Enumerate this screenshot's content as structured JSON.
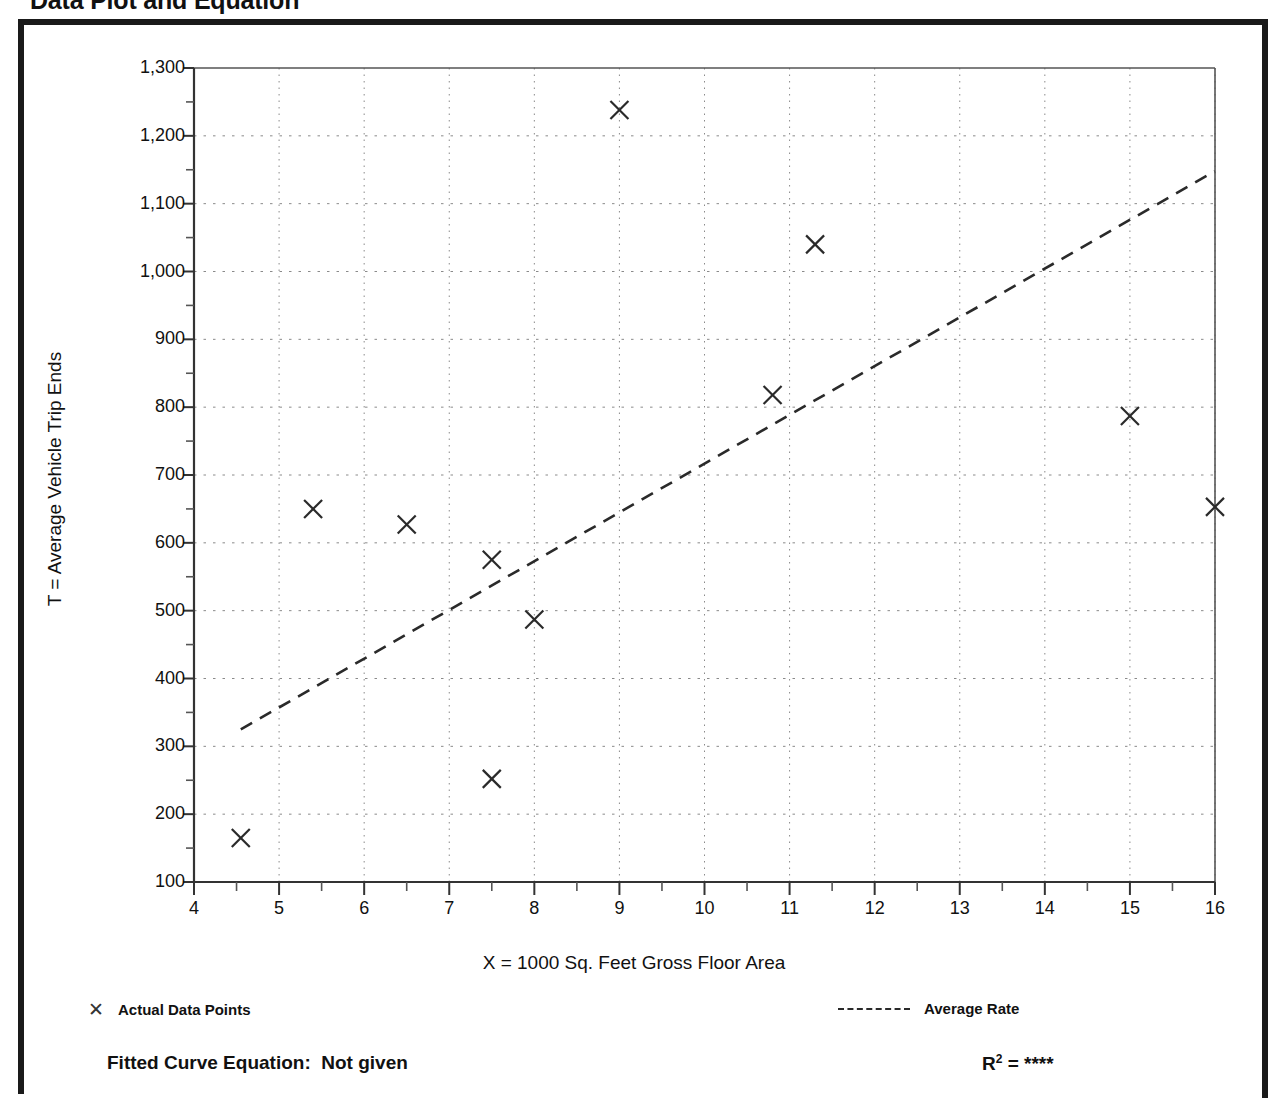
{
  "page": {
    "title": "Data Plot and Equation"
  },
  "legend": {
    "data_points_label": "Actual Data Points",
    "data_points_marker": "x-marker-icon",
    "average_rate_label": "Average Rate",
    "average_rate_marker": "dashed-line-icon"
  },
  "footer": {
    "fitted_curve_label": "Fitted Curve Equation:  Not given",
    "r_squared_prefix": "R",
    "r_squared_exponent": "2",
    "r_squared_equals": " = ",
    "r_squared_value": "****"
  },
  "chart_data": {
    "type": "scatter",
    "title": "Data Plot and Equation",
    "xlabel": "X = 1000 Sq. Feet Gross Floor Area",
    "ylabel": "T = Average Vehicle Trip Ends",
    "xlim": [
      4,
      16
    ],
    "ylim": [
      100,
      1300
    ],
    "xticks": [
      4,
      5,
      6,
      7,
      8,
      9,
      10,
      11,
      12,
      13,
      14,
      15,
      16
    ],
    "xtick_labels": [
      "4",
      "5",
      "6",
      "7",
      "8",
      "9",
      "10",
      "11",
      "12",
      "13",
      "14",
      "15",
      "16"
    ],
    "yticks": [
      100,
      200,
      300,
      400,
      500,
      600,
      700,
      800,
      900,
      1000,
      1100,
      1200,
      1300
    ],
    "ytick_labels": [
      "100",
      "200",
      "300",
      "400",
      "500",
      "600",
      "700",
      "800",
      "900",
      "1,000",
      "1,100",
      "1,200",
      "1,300"
    ],
    "y_minor_tick_step": 50,
    "grid": true,
    "grid_style": "dotted",
    "legend_position": "below-axes",
    "series": [
      {
        "name": "Actual Data Points",
        "type": "scatter",
        "marker": "x",
        "color": "#2a2a2a",
        "points": [
          {
            "x": 4.55,
            "y": 165
          },
          {
            "x": 5.4,
            "y": 650
          },
          {
            "x": 6.5,
            "y": 627
          },
          {
            "x": 7.5,
            "y": 575
          },
          {
            "x": 7.5,
            "y": 252
          },
          {
            "x": 8.0,
            "y": 487
          },
          {
            "x": 9.0,
            "y": 1238
          },
          {
            "x": 10.8,
            "y": 818
          },
          {
            "x": 11.3,
            "y": 1040
          },
          {
            "x": 15.0,
            "y": 787
          },
          {
            "x": 16.0,
            "y": 653
          }
        ]
      },
      {
        "name": "Average Rate",
        "type": "line",
        "linestyle": "dashed",
        "color": "#2a2a2a",
        "endpoints": [
          {
            "x": 4.55,
            "y": 325
          },
          {
            "x": 16.0,
            "y": 1148
          }
        ]
      }
    ]
  }
}
